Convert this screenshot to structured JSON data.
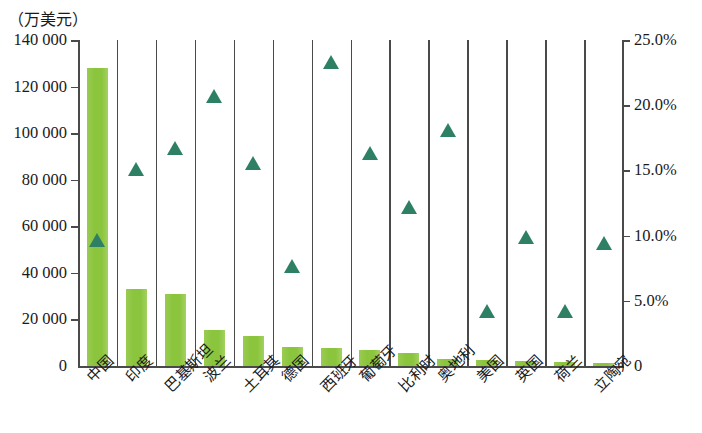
{
  "chart_data": {
    "type": "bar",
    "title": "",
    "subtitle": "",
    "xlabel": "",
    "ylabel": "（万美元）",
    "y2label": "",
    "grid": false,
    "legend": "none",
    "categories": [
      "中国",
      "印度",
      "巴基斯坦",
      "波兰",
      "土耳其",
      "德国",
      "西班牙",
      "葡萄牙",
      "比利时",
      "奥地利",
      "美国",
      "英国",
      "荷兰",
      "立陶宛"
    ],
    "series": [
      {
        "name": "金额",
        "type": "bar",
        "axis": "left",
        "color": "#8DC63F",
        "values": [
          128000,
          33000,
          31000,
          15500,
          12800,
          8200,
          7800,
          7000,
          5800,
          3200,
          2400,
          2200,
          1600,
          1200
        ]
      },
      {
        "name": "占比",
        "type": "scatter",
        "axis": "right",
        "color": "#2E8064",
        "marker": "triangle-up",
        "values": [
          9.7,
          15.1,
          16.7,
          20.7,
          15.6,
          7.7,
          23.3,
          16.3,
          12.2,
          18.1,
          4.2,
          9.9,
          4.2,
          9.4
        ]
      }
    ],
    "ylim": [
      0,
      140000
    ],
    "yticks": [
      0,
      20000,
      40000,
      60000,
      80000,
      100000,
      120000,
      140000
    ],
    "ytick_labels": [
      "0",
      "20 000",
      "40 000",
      "60 000",
      "80 000",
      "100 000",
      "120 000",
      "140 000"
    ],
    "y2lim": [
      0,
      25
    ],
    "y2ticks": [
      0,
      5,
      10,
      15,
      20,
      25
    ],
    "y2tick_labels": [
      "0",
      "5.0%",
      "10.0%",
      "15.0%",
      "20.0%",
      "25.0%"
    ]
  },
  "axes": {
    "unit_label": "（万美元）"
  },
  "colors": {
    "bar": "#8DC63F",
    "marker": "#2E8064",
    "axis": "#4a4a4a",
    "background": "#ffffff"
  }
}
